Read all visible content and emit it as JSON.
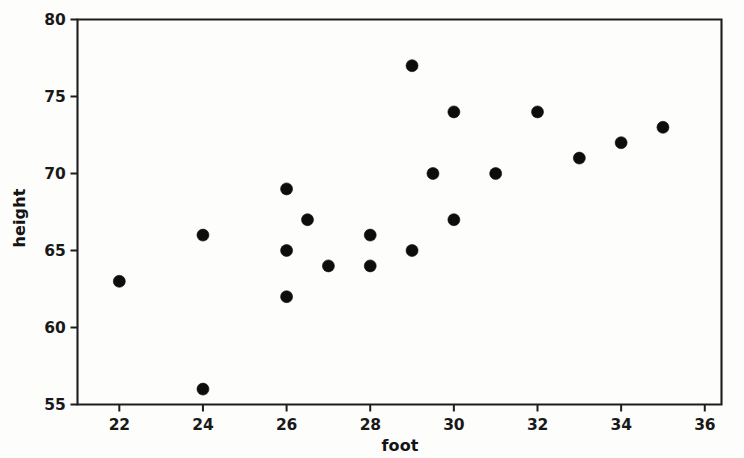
{
  "chart_data": {
    "type": "scatter",
    "title": "",
    "xlabel": "foot",
    "ylabel": "height",
    "xlim": [
      21,
      36.4
    ],
    "ylim": [
      55,
      80
    ],
    "xticks": [
      22,
      24,
      26,
      28,
      30,
      32,
      34,
      36
    ],
    "yticks": [
      55,
      60,
      65,
      70,
      75,
      80
    ],
    "xtick_labels": [
      "22",
      "24",
      "26",
      "28",
      "30",
      "32",
      "34",
      "36"
    ],
    "ytick_labels": [
      "55",
      "60",
      "65",
      "70",
      "75",
      "80"
    ],
    "grid": false,
    "legend": null,
    "marker": "filled-circle",
    "marker_color": "#0d0d0d",
    "marker_size": 6,
    "x": [
      22,
      24,
      24,
      26,
      26,
      26,
      26.5,
      27,
      28,
      28,
      29,
      29,
      29.5,
      30,
      30,
      31,
      32,
      33,
      34,
      35
    ],
    "y": [
      63,
      66,
      56,
      69,
      65,
      62,
      67,
      64,
      66,
      64,
      77,
      65,
      70,
      74,
      67,
      70,
      74,
      71,
      72,
      73
    ],
    "points": [
      {
        "foot": 22,
        "height": 63
      },
      {
        "foot": 24,
        "height": 66
      },
      {
        "foot": 24,
        "height": 56
      },
      {
        "foot": 26,
        "height": 69
      },
      {
        "foot": 26,
        "height": 65
      },
      {
        "foot": 26,
        "height": 62
      },
      {
        "foot": 26.5,
        "height": 67
      },
      {
        "foot": 27,
        "height": 64
      },
      {
        "foot": 28,
        "height": 66
      },
      {
        "foot": 28,
        "height": 64
      },
      {
        "foot": 29,
        "height": 77
      },
      {
        "foot": 29,
        "height": 65
      },
      {
        "foot": 29.5,
        "height": 70
      },
      {
        "foot": 30,
        "height": 74
      },
      {
        "foot": 30,
        "height": 67
      },
      {
        "foot": 31,
        "height": 70
      },
      {
        "foot": 32,
        "height": 74
      },
      {
        "foot": 33,
        "height": 71
      },
      {
        "foot": 34,
        "height": 72
      },
      {
        "foot": 35,
        "height": 73
      }
    ]
  },
  "colors": {
    "axis": "#1d1d1d",
    "marker": "#0d0d0d",
    "background": "#fdfdfc",
    "text": "#191919"
  }
}
